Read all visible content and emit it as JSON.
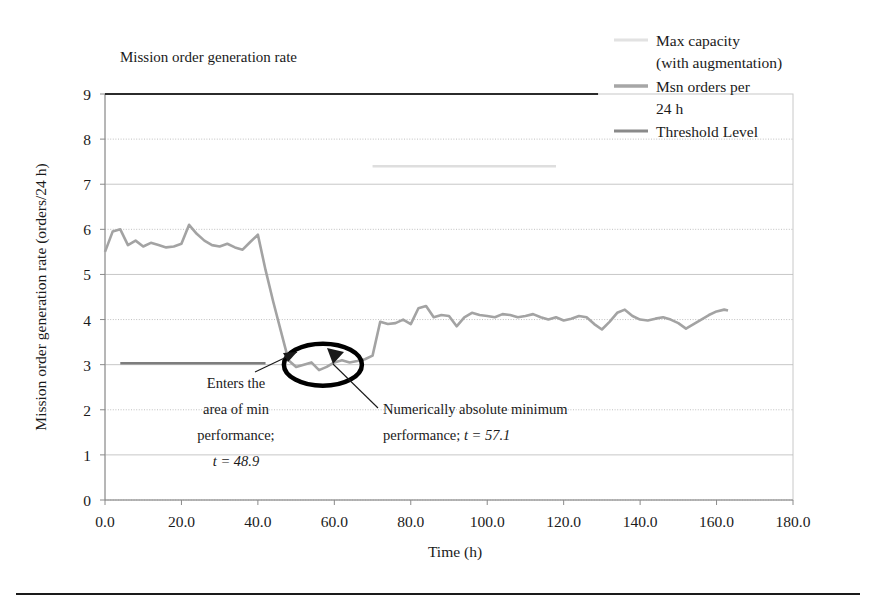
{
  "chart_data": {
    "type": "line",
    "title": "Mission order generation rate",
    "xlabel": "Time (h)",
    "ylabel": "Mission order generation rate (orders/24 h)",
    "xlim": [
      0,
      180
    ],
    "ylim": [
      0,
      9
    ],
    "xticks": [
      "0.0",
      "20.0",
      "40.0",
      "60.0",
      "80.0",
      "100.0",
      "120.0",
      "140.0",
      "160.0",
      "180.0"
    ],
    "xtick_values": [
      0,
      20,
      40,
      60,
      80,
      100,
      120,
      140,
      160,
      180
    ],
    "yticks": [
      "0",
      "1",
      "2",
      "3",
      "4",
      "5",
      "6",
      "7",
      "8",
      "9"
    ],
    "ytick_values": [
      0,
      1,
      2,
      3,
      4,
      5,
      6,
      7,
      8,
      9
    ],
    "grid": true,
    "legend_position": "top-right",
    "series": [
      {
        "name": "Max capacity (with augmentation)",
        "color": "#dcdcdc",
        "width": 2.4,
        "x": [
          0,
          130,
          130.001,
          180
        ],
        "values": [
          9,
          9,
          null,
          null
        ],
        "segments": [
          {
            "x": [
              0,
              129
            ],
            "y": [
              9,
              9
            ],
            "color": "#2b2b2b",
            "width": 2.2
          },
          {
            "x": [
              70,
              118
            ],
            "y": [
              7.4,
              7.4
            ],
            "color": "#dedede",
            "width": 2.6
          }
        ]
      },
      {
        "name": "Msn orders per 24 h",
        "color": "#a3a3a3",
        "width": 2.6,
        "x": [
          0,
          2,
          4,
          6,
          8,
          10,
          12,
          14,
          16,
          18,
          20,
          22,
          24,
          26,
          28,
          30,
          32,
          34,
          36,
          38,
          40,
          42,
          44,
          46,
          48,
          50,
          52,
          54,
          56,
          58,
          60,
          62,
          64,
          66,
          68,
          70,
          72,
          74,
          76,
          78,
          80,
          82,
          84,
          86,
          88,
          90,
          92,
          94,
          96,
          98,
          100,
          102,
          104,
          106,
          108,
          110,
          112,
          114,
          116,
          118,
          120,
          122,
          124,
          126,
          128,
          130,
          132,
          134,
          136,
          138,
          140,
          142,
          144,
          146,
          148,
          150,
          152,
          154,
          156,
          158,
          160,
          162,
          163
        ],
        "values": [
          5.5,
          5.95,
          6.0,
          5.65,
          5.75,
          5.62,
          5.7,
          5.65,
          5.6,
          5.62,
          5.68,
          6.1,
          5.9,
          5.75,
          5.65,
          5.62,
          5.68,
          5.6,
          5.55,
          5.72,
          5.88,
          5.1,
          4.4,
          3.75,
          3.1,
          2.95,
          3.0,
          3.05,
          2.88,
          2.95,
          3.05,
          3.1,
          3.05,
          3.08,
          3.12,
          3.2,
          3.95,
          3.9,
          3.92,
          4.0,
          3.9,
          4.25,
          4.3,
          4.05,
          4.1,
          4.08,
          3.85,
          4.05,
          4.15,
          4.1,
          4.08,
          4.05,
          4.12,
          4.1,
          4.05,
          4.08,
          4.12,
          4.05,
          4.0,
          4.05,
          3.98,
          4.02,
          4.08,
          4.05,
          3.9,
          3.78,
          3.95,
          4.15,
          4.22,
          4.08,
          4.0,
          3.98,
          4.02,
          4.05,
          4.0,
          3.92,
          3.8,
          3.9,
          4.0,
          4.1,
          4.18,
          4.22,
          4.2
        ]
      },
      {
        "name": "Threshold Level",
        "color": "#7d7d7d",
        "width": 2.4,
        "x": [
          4,
          42
        ],
        "values": [
          3.03,
          3.03
        ]
      }
    ],
    "annotations": [
      {
        "id": "enters-min-performance",
        "lines": [
          "Enters the",
          "area of min",
          "performance;"
        ],
        "italic_line": "t = 48.9",
        "target_x": 48.9,
        "target_y": 3.0
      },
      {
        "id": "absolute-minimum",
        "lines": [
          "Numerically absolute minimum"
        ],
        "second_line_prefix": "performance; ",
        "second_line_italic": "t = 57.1",
        "target_x": 57.1,
        "target_y": 2.88
      }
    ],
    "highlight_ellipse": {
      "label": "min-performance-region",
      "center_x": 57.0,
      "center_y": 3.0
    }
  },
  "legend": {
    "items": [
      {
        "label_line1": "Max capacity",
        "label_line2": "(with augmentation)",
        "color": "#e2e2e2"
      },
      {
        "label_line1": "Msn orders per",
        "label_line2": "24 h",
        "color": "#a6a6a6"
      },
      {
        "label_line1": "Threshold Level",
        "label_line2": "",
        "color": "#8a8a8a"
      }
    ]
  }
}
